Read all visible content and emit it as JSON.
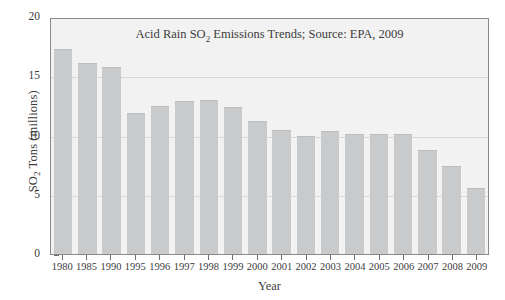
{
  "chart_data": {
    "type": "bar",
    "title_prefix": "Acid Rain SO",
    "title_sub": "2",
    "title_suffix": " Emissions Trends; Source: EPA, 2009",
    "title": "Acid Rain SO2 Emissions Trends; Source: EPA, 2009",
    "xlabel": "Year",
    "ylabel_prefix": "SO",
    "ylabel_sub": "2",
    "ylabel_suffix": " Tons (millions)",
    "ylabel": "SO2 Tons (millions)",
    "ylim": [
      0,
      20
    ],
    "yticks": [
      0,
      5,
      10,
      15,
      20
    ],
    "ytick_labels": [
      "0",
      "5",
      "10",
      "15",
      "20"
    ],
    "grid": true,
    "grid_axis": "y",
    "legend": null,
    "bar_color": "#c9cacb",
    "plot_background": "#f2f2f2",
    "frame_color": "#8a8a8a",
    "categories": [
      "1980",
      "1985",
      "1990",
      "1995",
      "1996",
      "1997",
      "1998",
      "1999",
      "2000",
      "2001",
      "2002",
      "2003",
      "2004",
      "2005",
      "2006",
      "2007",
      "2008",
      "2009"
    ],
    "values": [
      17.3,
      16.1,
      15.8,
      11.9,
      12.5,
      12.9,
      13.0,
      12.4,
      11.2,
      10.5,
      10.0,
      10.4,
      10.1,
      10.1,
      10.1,
      8.8,
      7.4,
      5.6
    ]
  }
}
